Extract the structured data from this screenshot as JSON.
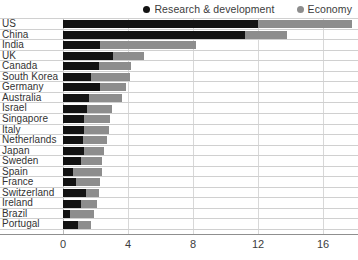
{
  "legend": {
    "position": "top-right",
    "entries": [
      {
        "label": "Research & development",
        "color": "#131313",
        "marker": "circle-marker-icon"
      },
      {
        "label": "Economy",
        "color": "#8d8d8d",
        "marker": "circle-marker-icon"
      }
    ]
  },
  "axis": {
    "x_ticks": [
      "0",
      "4",
      "8",
      "12",
      "16"
    ]
  },
  "chart_data": {
    "type": "bar",
    "orientation": "horizontal",
    "stacked": false,
    "overlaid": true,
    "title": "",
    "subtitle": "",
    "xlabel": "",
    "ylabel": "",
    "xlim": [
      0,
      18.1
    ],
    "xticks": [
      0,
      4,
      8,
      12,
      16
    ],
    "grid": "vertical",
    "legend_position": "top-right",
    "categories": [
      "US",
      "China",
      "India",
      "UK",
      "Canada",
      "South Korea",
      "Germany",
      "Australia",
      "Israel",
      "Singapore",
      "Italy",
      "Netherlands",
      "Japan",
      "Sweden",
      "Spain",
      "France",
      "Switzerland",
      "Ireland",
      "Brazil",
      "Portugal"
    ],
    "series": [
      {
        "name": "Research & development",
        "color": "#131313",
        "values": [
          12.0,
          11.2,
          2.3,
          3.1,
          2.2,
          1.7,
          2.3,
          1.6,
          1.5,
          1.3,
          1.3,
          1.2,
          1.3,
          1.1,
          0.6,
          0.8,
          1.4,
          1.1,
          0.4,
          0.9
        ]
      },
      {
        "name": "Economy",
        "color": "#8d8d8d",
        "values": [
          17.8,
          13.8,
          8.2,
          5.0,
          4.2,
          4.1,
          3.9,
          3.6,
          3.0,
          2.9,
          2.8,
          2.7,
          2.5,
          2.4,
          2.4,
          2.3,
          2.2,
          2.1,
          1.9,
          1.7
        ]
      }
    ]
  }
}
